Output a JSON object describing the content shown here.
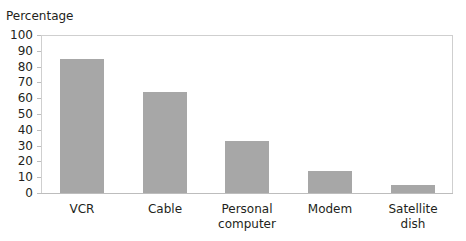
{
  "chart_data": {
    "type": "bar",
    "title": "",
    "xlabel": "",
    "ylabel": "Percentage",
    "ylim": [
      0,
      100
    ],
    "yticks": [
      "0",
      "10",
      "20",
      "30",
      "40",
      "50",
      "60",
      "70",
      "80",
      "90",
      "100"
    ],
    "categories": [
      "VCR",
      "Cable",
      "Personal\ncomputer",
      "Modem",
      "Satellite\ndish"
    ],
    "values": [
      85,
      64,
      33,
      14,
      5
    ],
    "bar_color": "#a7a7a7",
    "grid": false,
    "legend": null
  }
}
